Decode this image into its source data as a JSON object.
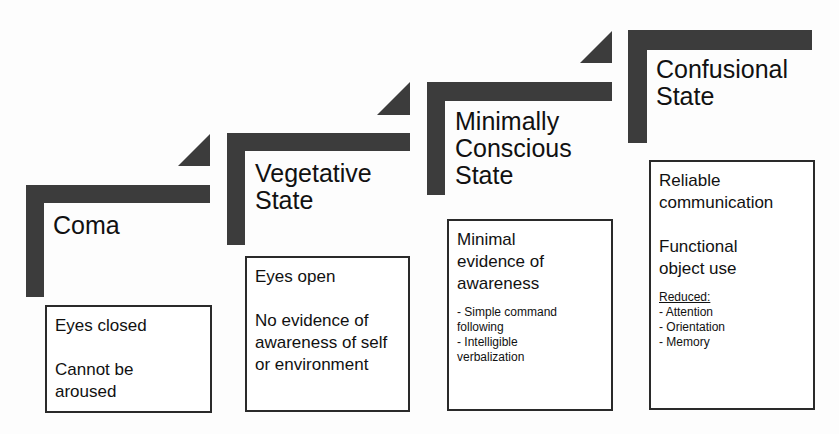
{
  "diagram": {
    "type": "staircase",
    "stages": [
      {
        "title": [
          "Coma"
        ],
        "criteria": [
          "Eyes closed",
          "Cannot be aroused"
        ]
      },
      {
        "title": [
          "Vegetative",
          "State"
        ],
        "criteria": [
          "Eyes open",
          "No evidence of awareness of self or environment"
        ]
      },
      {
        "title": [
          "Minimally",
          "Conscious",
          "State"
        ],
        "criteria": [
          "Minimal evidence of awareness"
        ],
        "details": [
          "- Simple command following",
          "- Intelligible verbalization"
        ]
      },
      {
        "title": [
          "Confusional",
          "State"
        ],
        "criteria": [
          "Reliable communication",
          "Functional object use"
        ],
        "details_heading": "Reduced:",
        "details": [
          "- Attention",
          "- Orientation",
          "- Memory"
        ]
      }
    ],
    "colors": {
      "bar": "#3c3c3c",
      "border": "#2a2a2a",
      "background": "#fdfdfd"
    }
  }
}
